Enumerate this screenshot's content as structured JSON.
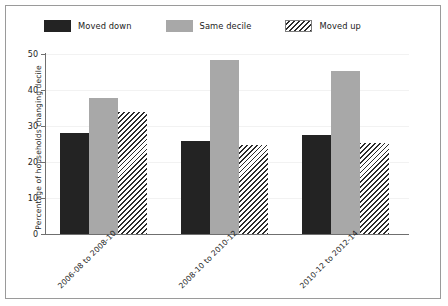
{
  "chart_data": {
    "type": "bar",
    "title": "",
    "subtitle": "",
    "xlabel": "",
    "ylabel": "Percentage of households changing decile",
    "categories": [
      "2006-08 to 2008-10",
      "2008-10 to 2010-12",
      "2010-12 to 2012-14"
    ],
    "series": [
      {
        "name": "Moved down",
        "values": [
          28.0,
          25.8,
          27.5
        ],
        "color": "#232323",
        "fill": "solid"
      },
      {
        "name": "Same decile",
        "values": [
          37.8,
          48.3,
          45.3
        ],
        "color": "#a8a8a8",
        "fill": "solid"
      },
      {
        "name": "Moved up",
        "values": [
          34.0,
          24.8,
          25.3
        ],
        "color": "#2b2b2b",
        "fill": "diagonal-hatch"
      }
    ],
    "ylim": [
      0,
      50
    ],
    "yticks": [
      0,
      10,
      20,
      30,
      40,
      50
    ],
    "ytick_labels": [
      "0",
      "10",
      "20",
      "30",
      "40",
      "50"
    ],
    "grid": false,
    "legend_position": "top-left",
    "legend_entries": [
      "Moved down",
      "Same decile",
      "Moved up"
    ]
  },
  "legend": {
    "items": [
      {
        "label": "Moved down",
        "swatch": "solid-dark-swatch"
      },
      {
        "label": "Same decile",
        "swatch": "solid-gray-swatch"
      },
      {
        "label": "Moved up",
        "swatch": "hatched-swatch"
      }
    ]
  },
  "axes": {
    "y_title": "Percentage of households changing decile",
    "y_ticks": [
      "50",
      "40",
      "30",
      "20",
      "10",
      "0"
    ],
    "x_ticks": [
      "2006-08 to 2008-10",
      "2008-10 to 2010-12",
      "2010-12 to 2012-14"
    ]
  }
}
